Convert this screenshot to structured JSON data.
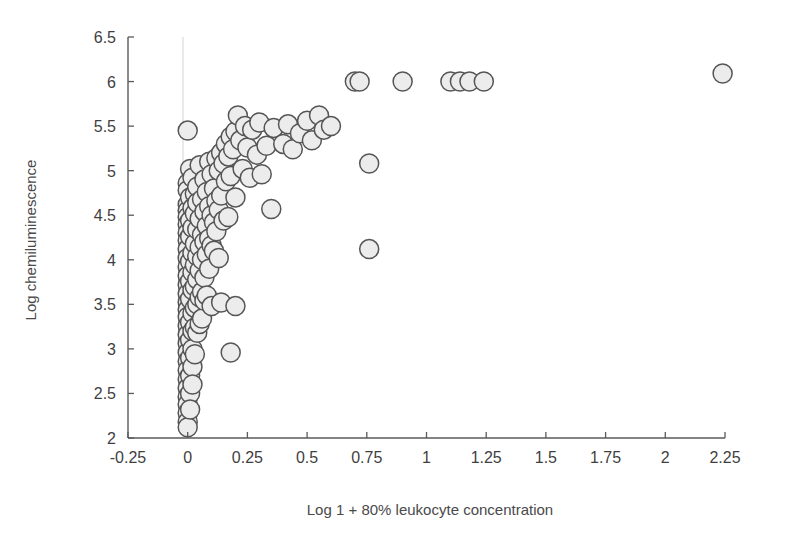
{
  "figure": {
    "background_color": "#ffffff",
    "marker_fill": "#ececec",
    "marker_stroke": "#555555",
    "axis_color": "#5a5a5a",
    "zero_line_color": "#d8d8d8"
  },
  "chart_data": {
    "type": "scatter",
    "title": "",
    "xlabel": "Log 1 + 80% leukocyte concentration",
    "ylabel": "Log chemiluminescence",
    "xlim": [
      -0.25,
      2.25
    ],
    "ylim": [
      2,
      6.5
    ],
    "xticks": [
      -0.25,
      0,
      0.25,
      0.5,
      0.75,
      1,
      1.25,
      1.5,
      1.75,
      2,
      2.25
    ],
    "yticks": [
      2,
      2.5,
      3,
      3.5,
      4,
      4.5,
      5,
      5.5,
      6,
      6.5
    ],
    "xtick_labels": [
      "-0.25",
      "0",
      "0.25",
      "0.5",
      "0.75",
      "1",
      "1.25",
      "1.5",
      "1.75",
      "2",
      "2.25"
    ],
    "ytick_labels": [
      "2",
      "2.5",
      "3",
      "3.5",
      "4",
      "4.5",
      "5",
      "5.5",
      "6",
      "6.5"
    ],
    "grid": false,
    "legend": null,
    "marker_size_px": 19,
    "annotations": [
      "Vertical reference line drawn at x = 0",
      "Saturation ceiling of points at y = 6.0"
    ],
    "points": [
      [
        0.0,
        5.45
      ],
      [
        0.0,
        4.86
      ],
      [
        0.0,
        4.78
      ],
      [
        0.0,
        4.62
      ],
      [
        0.0,
        4.55
      ],
      [
        0.0,
        4.48
      ],
      [
        0.0,
        4.4
      ],
      [
        0.0,
        4.3
      ],
      [
        0.0,
        4.22
      ],
      [
        0.0,
        4.12
      ],
      [
        0.0,
        4.02
      ],
      [
        0.0,
        3.92
      ],
      [
        0.0,
        3.82
      ],
      [
        0.0,
        3.72
      ],
      [
        0.0,
        3.62
      ],
      [
        0.0,
        3.52
      ],
      [
        0.0,
        3.44
      ],
      [
        0.0,
        3.36
      ],
      [
        0.0,
        3.26
      ],
      [
        0.0,
        3.16
      ],
      [
        0.0,
        3.06
      ],
      [
        0.0,
        2.96
      ],
      [
        0.0,
        2.86
      ],
      [
        0.0,
        2.76
      ],
      [
        0.0,
        2.66
      ],
      [
        0.0,
        2.56
      ],
      [
        0.0,
        2.46
      ],
      [
        0.0,
        2.38
      ],
      [
        0.0,
        2.28
      ],
      [
        0.0,
        2.18
      ],
      [
        0.0,
        2.12
      ],
      [
        0.01,
        5.02
      ],
      [
        0.01,
        4.7
      ],
      [
        0.01,
        4.44
      ],
      [
        0.01,
        4.26
      ],
      [
        0.01,
        3.98
      ],
      [
        0.01,
        3.76
      ],
      [
        0.01,
        3.56
      ],
      [
        0.01,
        3.3
      ],
      [
        0.01,
        3.1
      ],
      [
        0.01,
        2.9
      ],
      [
        0.01,
        2.7
      ],
      [
        0.01,
        2.5
      ],
      [
        0.01,
        2.32
      ],
      [
        0.02,
        4.92
      ],
      [
        0.02,
        4.58
      ],
      [
        0.02,
        4.36
      ],
      [
        0.02,
        4.08
      ],
      [
        0.02,
        3.86
      ],
      [
        0.02,
        3.66
      ],
      [
        0.02,
        3.4
      ],
      [
        0.02,
        3.2
      ],
      [
        0.02,
        3.0
      ],
      [
        0.02,
        2.8
      ],
      [
        0.02,
        2.6
      ],
      [
        0.03,
        4.74
      ],
      [
        0.03,
        4.52
      ],
      [
        0.03,
        4.18
      ],
      [
        0.03,
        3.94
      ],
      [
        0.03,
        3.7
      ],
      [
        0.03,
        3.46
      ],
      [
        0.03,
        3.24
      ],
      [
        0.03,
        2.94
      ],
      [
        0.04,
        4.82
      ],
      [
        0.04,
        4.64
      ],
      [
        0.04,
        4.34
      ],
      [
        0.04,
        4.04
      ],
      [
        0.04,
        3.78
      ],
      [
        0.04,
        3.5
      ],
      [
        0.04,
        3.18
      ],
      [
        0.05,
        5.06
      ],
      [
        0.05,
        4.46
      ],
      [
        0.05,
        4.14
      ],
      [
        0.05,
        3.88
      ],
      [
        0.05,
        3.58
      ],
      [
        0.05,
        3.28
      ],
      [
        0.06,
        4.68
      ],
      [
        0.06,
        4.28
      ],
      [
        0.06,
        4.0
      ],
      [
        0.06,
        3.64
      ],
      [
        0.06,
        3.34
      ],
      [
        0.07,
        4.9
      ],
      [
        0.07,
        4.54
      ],
      [
        0.07,
        4.2
      ],
      [
        0.07,
        3.8
      ],
      [
        0.07,
        3.54
      ],
      [
        0.08,
        4.76
      ],
      [
        0.08,
        4.38
      ],
      [
        0.08,
        4.06
      ],
      [
        0.08,
        3.6
      ],
      [
        0.09,
        5.1
      ],
      [
        0.09,
        4.6
      ],
      [
        0.09,
        4.24
      ],
      [
        0.09,
        3.9
      ],
      [
        0.1,
        4.96
      ],
      [
        0.1,
        4.5
      ],
      [
        0.1,
        4.16
      ],
      [
        0.1,
        3.48
      ],
      [
        0.11,
        4.8
      ],
      [
        0.11,
        4.42
      ],
      [
        0.11,
        4.1
      ],
      [
        0.12,
        5.14
      ],
      [
        0.12,
        4.66
      ],
      [
        0.12,
        4.32
      ],
      [
        0.13,
        5.0
      ],
      [
        0.13,
        4.56
      ],
      [
        0.13,
        4.02
      ],
      [
        0.14,
        5.2
      ],
      [
        0.14,
        4.72
      ],
      [
        0.14,
        3.52
      ],
      [
        0.15,
        5.08
      ],
      [
        0.15,
        4.44
      ],
      [
        0.16,
        5.3
      ],
      [
        0.16,
        4.88
      ],
      [
        0.17,
        5.16
      ],
      [
        0.17,
        4.48
      ],
      [
        0.18,
        5.38
      ],
      [
        0.18,
        4.94
      ],
      [
        0.18,
        2.96
      ],
      [
        0.19,
        5.24
      ],
      [
        0.2,
        5.44
      ],
      [
        0.2,
        4.7
      ],
      [
        0.2,
        3.48
      ],
      [
        0.21,
        5.62
      ],
      [
        0.22,
        5.34
      ],
      [
        0.23,
        5.02
      ],
      [
        0.24,
        5.5
      ],
      [
        0.25,
        5.26
      ],
      [
        0.26,
        4.92
      ],
      [
        0.27,
        5.46
      ],
      [
        0.29,
        5.18
      ],
      [
        0.3,
        5.54
      ],
      [
        0.31,
        4.96
      ],
      [
        0.33,
        5.28
      ],
      [
        0.35,
        4.57
      ],
      [
        0.36,
        5.48
      ],
      [
        0.4,
        5.3
      ],
      [
        0.42,
        5.52
      ],
      [
        0.44,
        5.24
      ],
      [
        0.47,
        5.42
      ],
      [
        0.5,
        5.56
      ],
      [
        0.52,
        5.34
      ],
      [
        0.55,
        5.62
      ],
      [
        0.57,
        5.46
      ],
      [
        0.6,
        5.5
      ],
      [
        0.7,
        6.0
      ],
      [
        0.72,
        6.0
      ],
      [
        0.76,
        5.08
      ],
      [
        0.76,
        4.12
      ],
      [
        0.9,
        6.0
      ],
      [
        1.1,
        6.0
      ],
      [
        1.14,
        6.0
      ],
      [
        1.18,
        6.0
      ],
      [
        1.24,
        6.0
      ],
      [
        2.24,
        6.09
      ]
    ]
  }
}
